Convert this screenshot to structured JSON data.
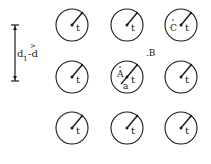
{
  "diagram": {
    "dimension_label": {
      "d": "d",
      "sub": "1",
      "rel": ">",
      "rhs": "-d"
    },
    "radius_label": "t",
    "points": {
      "A": "A",
      "B": ".B",
      "C": "C",
      "a": "a"
    },
    "circles": [
      {
        "cx": 72,
        "cy": 25,
        "extra": ""
      },
      {
        "cx": 127,
        "cy": 25,
        "extra": ""
      },
      {
        "cx": 181,
        "cy": 25,
        "extra": "C"
      },
      {
        "cx": 72,
        "cy": 77,
        "extra": ""
      },
      {
        "cx": 127,
        "cy": 77,
        "extra": "A"
      },
      {
        "cx": 181,
        "cy": 77,
        "extra": ""
      },
      {
        "cx": 72,
        "cy": 128,
        "extra": ""
      },
      {
        "cx": 127,
        "cy": 128,
        "extra": ""
      },
      {
        "cx": 181,
        "cy": 128,
        "extra": ""
      }
    ],
    "colors": {
      "ink": "#1a1a1a",
      "background": "#ffffff"
    }
  }
}
